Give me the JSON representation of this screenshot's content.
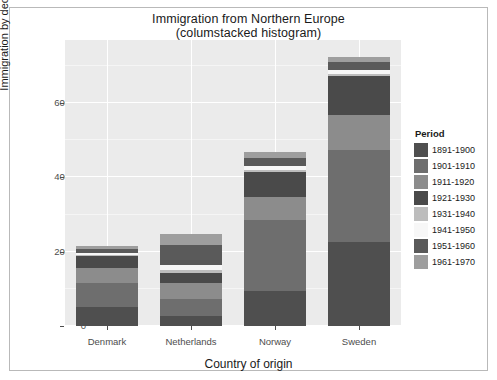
{
  "figure": {
    "title": "Immigration from Northern Europe",
    "subtitle": "(columstacked histogram)"
  },
  "legend": {
    "title": "Period",
    "position": "right"
  },
  "chart_data": {
    "type": "bar",
    "subtype": "stacked-bar",
    "title": "Immigration from Northern Europe",
    "subtitle": "(columstacked histogram)",
    "xlabel": "Country of origin",
    "ylabel": "Immigration by decade",
    "categories": [
      "Denmark",
      "Netherlands",
      "Norway",
      "Sweden"
    ],
    "ylim": [
      0,
      770000
    ],
    "yticks": [
      0,
      200000,
      400000,
      600000
    ],
    "ytick_labels": [
      "0",
      "200000",
      "400000",
      "600000"
    ],
    "grid": true,
    "legend_title": "Period",
    "legend_position": "right",
    "series": [
      {
        "name": "1891-1900",
        "color": "#4f4f4f",
        "values": [
          50000,
          26000,
          95000,
          226000
        ]
      },
      {
        "name": "1901-1910",
        "color": "#6e6e6e",
        "values": [
          65000,
          48000,
          190000,
          248000
        ]
      },
      {
        "name": "1911-1920",
        "color": "#8c8c8c",
        "values": [
          41000,
          43000,
          62000,
          95000
        ]
      },
      {
        "name": "1921-1930",
        "color": "#4a4a4a",
        "values": [
          32000,
          26000,
          68000,
          105000
        ]
      },
      {
        "name": "1931-1940",
        "color": "#bdbdbd",
        "values": [
          2900,
          7100,
          4700,
          3900
        ]
      },
      {
        "name": "1941-1950",
        "color": "#f7f7f7",
        "values": [
          5400,
          14800,
          10100,
          10700
        ]
      },
      {
        "name": "1951-1960",
        "color": "#5a5a5a",
        "values": [
          10900,
          52000,
          23000,
          22000
        ]
      },
      {
        "name": "1961-1970",
        "color": "#9e9e9e",
        "values": [
          9000,
          30000,
          15000,
          14000
        ]
      }
    ],
    "totals": [
      216200,
      246900,
      467800,
      724600
    ],
    "colors": {
      "panel_background": "#ebebeb",
      "gridline": "#ffffff",
      "figure_background": "#ffffff",
      "text": "#1a1a1a",
      "tick_text": "#4d4d4d"
    }
  }
}
